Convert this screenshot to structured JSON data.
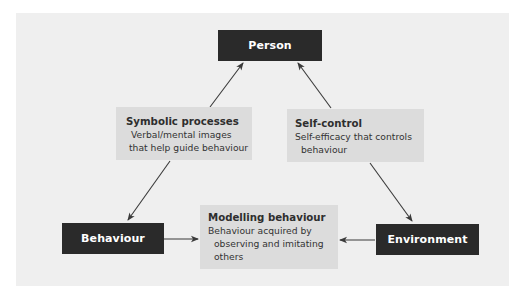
{
  "diagram": {
    "type": "triangle-relationship",
    "nodes": {
      "person": {
        "label": "Person"
      },
      "behaviour": {
        "label": "Behaviour"
      },
      "environment": {
        "label": "Environment"
      }
    },
    "processes": {
      "symbolic": {
        "title": "Symbolic processes",
        "lines": [
          "Verbal/mental images",
          "that help guide behaviour"
        ]
      },
      "self_control": {
        "title": "Self-control",
        "lines": [
          "Self-efficacy that controls",
          "behaviour"
        ]
      },
      "modelling": {
        "title": "Modelling behaviour",
        "lines": [
          "Behaviour acquired by",
          "observing and imitating",
          "others"
        ]
      }
    },
    "edges": [
      {
        "from": "symbolic",
        "to": "person"
      },
      {
        "from": "symbolic",
        "to": "behaviour"
      },
      {
        "from": "self_control",
        "to": "person"
      },
      {
        "from": "self_control",
        "to": "environment"
      },
      {
        "from": "behaviour",
        "to": "modelling"
      },
      {
        "from": "environment",
        "to": "modelling"
      }
    ],
    "colors": {
      "panel": "#efefef",
      "dark_box": "#2a2a2a",
      "light_box": "#dcdcdc",
      "arrow": "#3a3a3a"
    }
  }
}
